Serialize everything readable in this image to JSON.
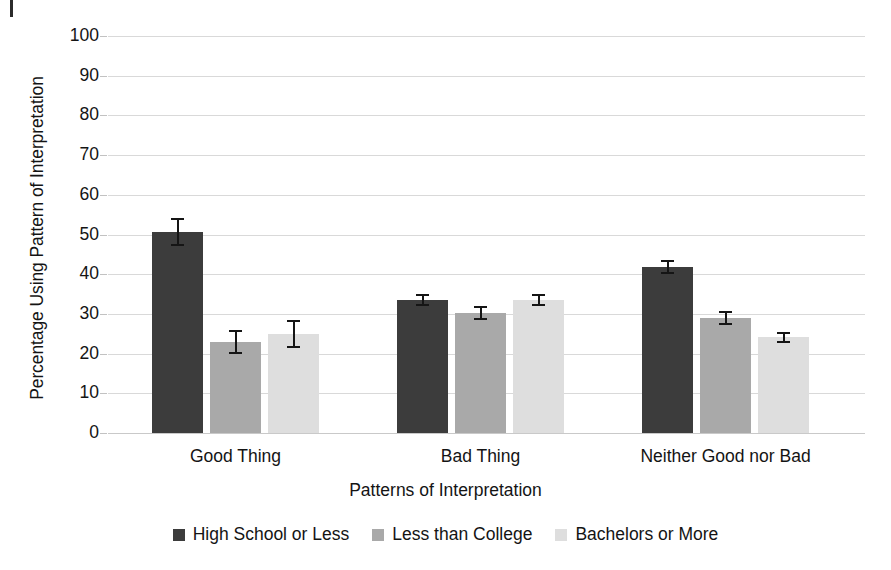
{
  "figure": {
    "artifact_name": "scan-artifact-mark"
  },
  "chart_data": {
    "type": "bar",
    "title": "",
    "xlabel": "Patterns of Interpretation",
    "ylabel": "Percentage Using Pattern of Interpretation",
    "ylim": [
      0,
      100
    ],
    "ytick_step": 10,
    "ytick_labels": [
      "100",
      "90",
      "80",
      "70",
      "60",
      "50",
      "40",
      "30",
      "20",
      "10",
      "0"
    ],
    "yticks": [
      100,
      90,
      80,
      70,
      60,
      50,
      40,
      30,
      20,
      10,
      0
    ],
    "grid": true,
    "grid_axis": "y",
    "legend_position": "bottom-center",
    "error_bars": true,
    "categories": [
      "Good Thing",
      "Bad Thing",
      "Neither Good nor Bad"
    ],
    "series": [
      {
        "name": "High School or Less",
        "color": "#3c3c3c",
        "values": [
          50.6,
          33.5,
          41.8
        ],
        "errors": [
          3.6,
          1.5,
          1.7
        ]
      },
      {
        "name": "Less than College",
        "color": "#a9a9a9",
        "values": [
          23.0,
          30.3,
          28.9
        ],
        "errors": [
          3.0,
          1.8,
          1.8
        ]
      },
      {
        "name": "Bachelors or More",
        "color": "#dedede",
        "values": [
          25.0,
          33.4,
          24.1
        ],
        "errors": [
          3.5,
          1.5,
          1.4
        ]
      }
    ]
  }
}
